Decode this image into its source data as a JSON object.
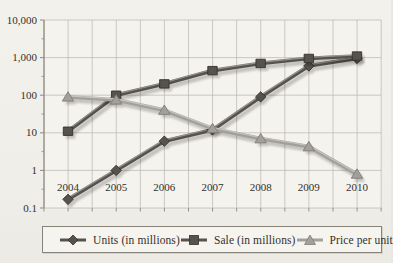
{
  "chart_data": {
    "type": "line",
    "title": "",
    "xlabel": "",
    "ylabel": "",
    "y_scale": "log",
    "ylim": [
      0.1,
      10000
    ],
    "y_tick_labels": [
      "10,000",
      "1,000",
      "100",
      "10",
      "1",
      "0.1"
    ],
    "x_categories": [
      "2004",
      "2005",
      "2006",
      "2007",
      "2008",
      "2009",
      "2010"
    ],
    "grid": true,
    "legend_position": "bottom",
    "colors": {
      "dark_series": "#56524c",
      "dark_series_edge": "#35322d",
      "light_series": "#a3a099",
      "light_series_edge": "#807d76",
      "gridline": "#bfbcb5",
      "axis": "#8d897f",
      "text": "#33302a"
    },
    "series": [
      {
        "name": "Units (in millions)",
        "marker": "diamond",
        "shade": "dark",
        "values": [
          0.17,
          1,
          6,
          12,
          90,
          600,
          950
        ]
      },
      {
        "name": "Sale (in millions)",
        "marker": "square",
        "shade": "dark",
        "values": [
          11,
          100,
          200,
          450,
          700,
          950,
          1100
        ]
      },
      {
        "name": "Price per unit",
        "marker": "triangle",
        "shade": "light",
        "values": [
          90,
          75,
          40,
          13,
          7,
          4.3,
          0.8
        ]
      }
    ]
  }
}
